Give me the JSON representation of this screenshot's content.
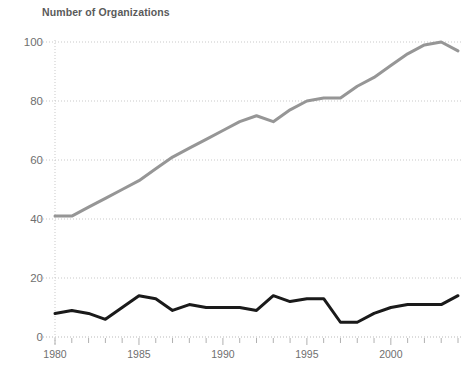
{
  "chart_data": {
    "type": "line",
    "title": "Number of Organizations",
    "xlabel": "",
    "ylabel": "",
    "xlim": [
      1980,
      2004
    ],
    "ylim": [
      0,
      105
    ],
    "yticks": [
      0,
      20,
      40,
      60,
      80,
      100
    ],
    "xticks": [
      1980,
      1985,
      1990,
      1995,
      2000
    ],
    "xtick_labels": [
      "1980",
      "1985",
      "1990",
      "1995",
      "2000"
    ],
    "ytick_labels": [
      "0",
      "20",
      "40",
      "60",
      "80",
      "100"
    ],
    "grid": true,
    "legend": "none",
    "x": [
      1980,
      1981,
      1982,
      1983,
      1984,
      1985,
      1986,
      1987,
      1988,
      1989,
      1990,
      1991,
      1992,
      1993,
      1994,
      1995,
      1996,
      1997,
      1998,
      1999,
      2000,
      2001,
      2002,
      2003,
      2004
    ],
    "series": [
      {
        "name": "upper-gray-series",
        "color": "#969696",
        "width": 3.0,
        "values": [
          41,
          41,
          44,
          47,
          50,
          53,
          57,
          61,
          64,
          67,
          70,
          73,
          75,
          73,
          77,
          80,
          81,
          81,
          85,
          88,
          92,
          96,
          99,
          100,
          97
        ]
      },
      {
        "name": "lower-black-series",
        "color": "#1a1a1a",
        "width": 3.0,
        "values": [
          8,
          9,
          8,
          6,
          10,
          14,
          13,
          9,
          11,
          10,
          10,
          10,
          9,
          14,
          12,
          13,
          13,
          5,
          5,
          8,
          10,
          11,
          11,
          11,
          14
        ]
      }
    ]
  },
  "axes": {
    "ytick_count": 6,
    "xtick_year_start": 1980,
    "xtick_year_end": 2004
  }
}
